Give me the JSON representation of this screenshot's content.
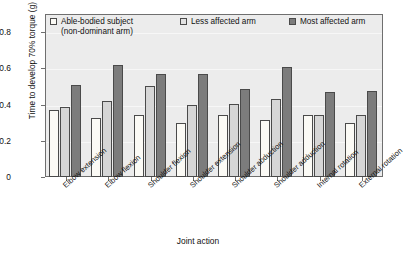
{
  "chart_data": {
    "type": "bar",
    "title": "",
    "xlabel": "Joint action",
    "ylabel": "Time to develop 70% torque (g)",
    "ylim": [
      0,
      0.9
    ],
    "yticks": [
      0,
      0.2,
      0.4,
      0.6,
      0.8
    ],
    "ytick_labels": [
      "0",
      "0.2",
      "0.4",
      "0.6",
      "0.8"
    ],
    "grid": true,
    "legend_position": "top-inside",
    "categories": [
      "Elbow extension",
      "Elbow flexion",
      "Shoulder flexion",
      "Shoulder extension",
      "Shoulder abduction",
      "Shoulder adduction",
      "Internal rotation",
      "External rotation"
    ],
    "series": [
      {
        "name": "Able-bodied subject (non-dominant arm)",
        "legend_line1": "Able-bodied subject",
        "legend_line2": "(non-dominant arm)",
        "color": "#fbfaf5",
        "values": [
          0.37,
          0.325,
          0.34,
          0.3,
          0.345,
          0.315,
          0.34,
          0.3
        ]
      },
      {
        "name": "Less affected arm",
        "legend_line1": "Less affected arm",
        "legend_line2": "",
        "color": "#d6d6d6",
        "values": [
          0.385,
          0.42,
          0.5,
          0.4,
          0.405,
          0.43,
          0.345,
          0.34
        ]
      },
      {
        "name": "Most affected arm",
        "legend_line1": "Most affected arm",
        "legend_line2": "",
        "color": "#7c7c7c",
        "values": [
          0.51,
          0.62,
          0.57,
          0.57,
          0.485,
          0.605,
          0.47,
          0.475
        ]
      }
    ]
  },
  "style": {
    "plot_background": "#ececec",
    "frame_color": "#6f6f6f",
    "gridline_color": "#f7f7f7",
    "bar_outline": "#4a4a4a"
  }
}
